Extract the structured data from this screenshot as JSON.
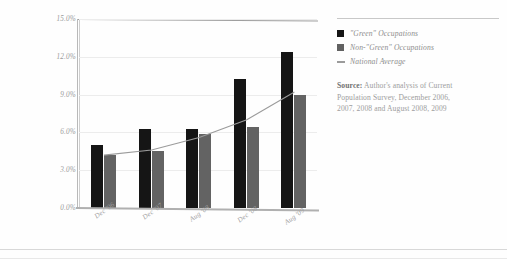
{
  "chart_data": {
    "type": "bar",
    "title": "",
    "subtitle": "",
    "xlabel": "",
    "ylabel": "",
    "categories": [
      "Dec '06",
      "Dec '07",
      "Aug '08",
      "Dec '08",
      "Aug '09"
    ],
    "series": [
      {
        "name": "\"Green\" Occupations",
        "type": "bar",
        "color": "#151515",
        "values": [
          5.0,
          6.3,
          6.3,
          10.2,
          12.4
        ]
      },
      {
        "name": "Non-\"Green\" Occupations",
        "type": "bar",
        "color": "#636363",
        "values": [
          4.2,
          4.5,
          5.9,
          6.4,
          9.0
        ]
      },
      {
        "name": "National Average",
        "type": "line",
        "color": "#9b9b9b",
        "values": [
          4.2,
          4.6,
          5.6,
          7.0,
          9.2
        ]
      }
    ],
    "ylim": [
      0,
      15
    ],
    "yticks": [
      0.0,
      3.0,
      6.0,
      9.0,
      12.0,
      15.0
    ],
    "ytick_labels": [
      "0.0%",
      "3.0%",
      "6.0%",
      "9.0%",
      "12.0%",
      "15.0%"
    ],
    "grid": true,
    "legend_position": "right"
  },
  "legend": {
    "items": [
      {
        "label": "\"Green\" Occupations",
        "marker": "square",
        "color": "#151515"
      },
      {
        "label": "Non-\"Green\" Occupations",
        "marker": "square",
        "color": "#616161"
      },
      {
        "label": "National Average",
        "marker": "line",
        "color": "#9b9b9b"
      }
    ]
  },
  "source": {
    "label": "Source:",
    "line1_rest": " Author's analysis of Current",
    "line2": "Population Survey, December 2006,",
    "line3": "2007, 2008 and August 2008, 2009"
  }
}
